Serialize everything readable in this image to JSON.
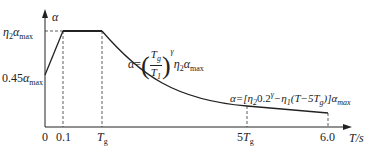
{
  "diagram": {
    "type": "seismic-influence-coefficient-curve",
    "axes": {
      "y_label": "α",
      "x_label": "T/s",
      "x_ticks": [
        "0",
        "0.1",
        "T_g",
        "5T_g",
        "6.0"
      ],
      "y_ticks": [
        "0.45α_max",
        "η2α_max"
      ]
    },
    "labels": {
      "y_axis": "α",
      "x_axis": "T/s",
      "tick_0": "0",
      "tick_01": "0.1",
      "tick_tg_main": "T",
      "tick_tg_sub": "g",
      "tick_5tg_pre": "5",
      "tick_5tg_main": "T",
      "tick_5tg_sub": "g",
      "tick_60": "6.0",
      "y_045_pre": "0.45",
      "y_045_alpha": "α",
      "y_045_sub": "max",
      "y_peak_eta": "η",
      "y_peak_eta_sub": "2",
      "y_peak_alpha": "α",
      "y_peak_sub": "max"
    },
    "formulas": {
      "descending_curve": {
        "lhs": "α",
        "eq": "=",
        "num_main": "T",
        "num_sub": "g",
        "den_main": "T",
        "den_sub": "1",
        "exponent": "γ",
        "eta": "η",
        "eta_sub": "2",
        "alpha": "α",
        "alpha_sub": "max"
      },
      "linear_segment": {
        "text_a": "α=[η",
        "sub_2": "2",
        "text_b": "0.2",
        "sup_gamma": "γ",
        "text_c": "−η",
        "sub_1": "1",
        "text_d": "(T−5T",
        "sub_g": "g",
        "text_e": ")]α",
        "sub_max": "max"
      }
    },
    "segments": [
      {
        "name": "rising",
        "from": "T=0, α=0.45α_max",
        "to": "T=0.1, α=η2α_max",
        "shape": "linear"
      },
      {
        "name": "plateau",
        "from": "T=0.1",
        "to": "T=T_g",
        "value": "η2α_max"
      },
      {
        "name": "curved-descent",
        "from": "T=T_g",
        "to": "T=5T_g",
        "formula": "α=(Tg/T1)^γ η2 α_max"
      },
      {
        "name": "linear-descent",
        "from": "T=5T_g",
        "to": "T=6.0",
        "formula": "α=[η2 0.2^γ − η1(T−5Tg)]α_max"
      }
    ],
    "colors": {
      "line": "#222222",
      "dash": "#333333"
    }
  }
}
